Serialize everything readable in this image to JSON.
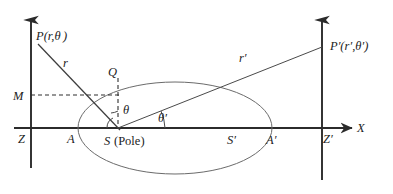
{
  "figure": {
    "background_color": "#ffffff",
    "axis_color": "#2b2b2b",
    "curve_color": "#6b6b6b",
    "ray_color": "#4a4a4a",
    "width": 393,
    "height": 194
  },
  "labels": {
    "point_p": "P(r,θ )",
    "point_p_prime": "P′(r′,θ′)",
    "radius_r": "r",
    "radius_r_prime": "r′",
    "point_q": "Q",
    "point_m": "M",
    "point_z": "Z",
    "point_z_prime": "Z′",
    "point_a": "A",
    "point_a_prime": "A′",
    "point_s_pole_italic": "S",
    "point_s_pole_paren": "(Pole)",
    "point_s_prime": "S′",
    "angle_theta": "θ",
    "angle_theta_prime": "θ′",
    "axis_x": "X"
  },
  "geometry": {
    "pole_s": {
      "x": 118,
      "y": 128
    },
    "point_p": {
      "x": 38,
      "y": 44
    },
    "point_p_prime": {
      "x": 322,
      "y": 47
    },
    "point_q": {
      "x": 118,
      "y": 78
    },
    "point_m": {
      "x": 31,
      "y": 95
    },
    "left_axis_x": 31,
    "right_axis_x": 322,
    "baseline_y": 128,
    "ellipse_center": {
      "x": 175,
      "y": 128
    },
    "ellipse_rx": 97,
    "ellipse_ry": 46,
    "vertex_a": {
      "x": 78,
      "y": 128
    },
    "vertex_a_prime": {
      "x": 272,
      "y": 128
    },
    "focus_s_prime": {
      "x": 233,
      "y": 128
    },
    "angle_theta_deg": 90,
    "angle_theta_prime_deg": 22
  }
}
